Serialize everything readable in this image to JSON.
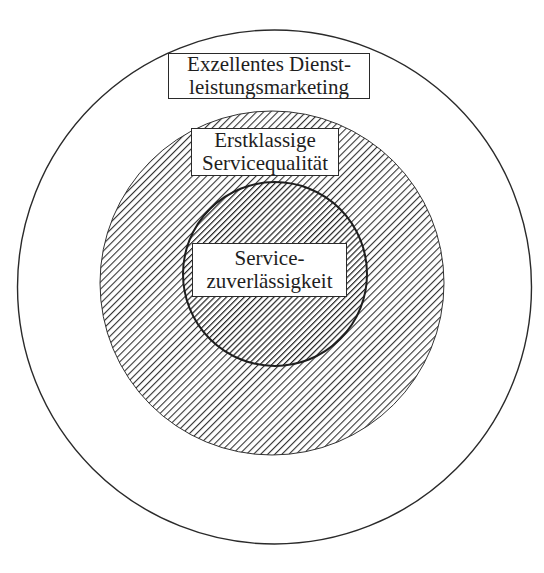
{
  "diagram": {
    "type": "concentric-circles",
    "layers": [
      {
        "level": "outer",
        "fill": "none",
        "label_lines": [
          "Exzellentes Dienst-",
          "leistungsmarketing"
        ],
        "label_full": "Exzellentes Dienstleistungsmarketing"
      },
      {
        "level": "middle",
        "fill": "diagonal-hatch-light",
        "label_lines": [
          "Erstklassige",
          "Servicequalität"
        ],
        "label_full": "Erstklassige Servicequalität"
      },
      {
        "level": "inner",
        "fill": "diagonal-hatch-dense",
        "label_lines": [
          "Service-",
          "zuverlässigkeit"
        ],
        "label_full": "Servicezuverlässigkeit"
      }
    ],
    "colors": {
      "stroke": "#2a2a2a",
      "hatch": "#333333",
      "background": "#ffffff"
    }
  }
}
